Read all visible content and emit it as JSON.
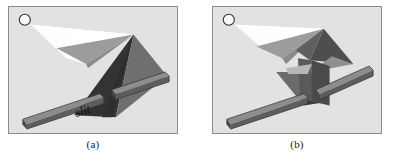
{
  "figure": {
    "background_color": "#ffffff",
    "panel_background": "#e2e2e2",
    "panel_border_color": "#8d8d8d",
    "palette": {
      "beam_light": "#ffffff",
      "beam_pale": "#f2f2f2",
      "cone_mid_gray": "#6f6f6f",
      "cone_light_gray": "#9a9a9a",
      "cone_dark_gray": "#555555",
      "shadow_darkest": "#333333",
      "bar_face": "#5f5f5f",
      "bar_top": "#8e8e8e",
      "bar_edge": "#3a3a3a",
      "label_color": "#111111"
    }
  },
  "panels": [
    {
      "id": "a",
      "caption": "(a)",
      "source_icon": "light-source-circle",
      "slit_label": "slit",
      "elements": [
        "light-source",
        "white-beam",
        "converging-cone",
        "diverging-shadow-fan",
        "slit-bar-left",
        "slit-bar-right"
      ]
    },
    {
      "id": "b",
      "caption": "(b)",
      "source_icon": "light-source-circle",
      "slit_label": "",
      "elements": [
        "light-source",
        "white-beam",
        "converging-cone",
        "reconverging-cone",
        "vertical-fan",
        "slit-bar-left",
        "slit-bar-right"
      ]
    }
  ]
}
